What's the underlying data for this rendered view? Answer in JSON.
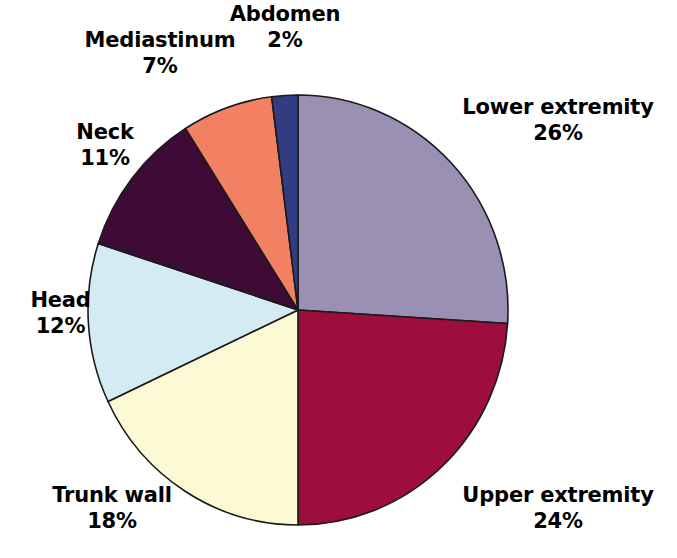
{
  "chart_data": {
    "type": "pie",
    "title": "",
    "subtitle": "",
    "xlabel": "",
    "ylabel": "",
    "legend_position": "none",
    "grid": false,
    "value_unit": "%",
    "start_angle_deg": 0,
    "direction": "clockwise",
    "categories": [
      "Lower extremity",
      "Upper extremity",
      "Trunk wall",
      "Head",
      "Neck",
      "Mediastinum",
      "Abdomen"
    ],
    "values": [
      26,
      24,
      18,
      12,
      11,
      7,
      2
    ],
    "colors": [
      "#9a90b4",
      "#9d0e3e",
      "#fcfad4",
      "#d5ebf3",
      "#3e0b36",
      "#f28063",
      "#313d80"
    ],
    "slices": [
      {
        "label": "Lower extremity",
        "value": 26,
        "value_text": "26%",
        "color": "#9a90b4"
      },
      {
        "label": "Upper extremity",
        "value": 24,
        "value_text": "24%",
        "color": "#9d0e3e"
      },
      {
        "label": "Trunk wall",
        "value": 18,
        "value_text": "18%",
        "color": "#fcfad4"
      },
      {
        "label": "Head",
        "value": 12,
        "value_text": "12%",
        "color": "#d5ebf3"
      },
      {
        "label": "Neck",
        "value": 11,
        "value_text": "11%",
        "color": "#3e0b36"
      },
      {
        "label": "Mediastinum",
        "value": 7,
        "value_text": "7%",
        "color": "#f28063"
      },
      {
        "label": "Abdomen",
        "value": 2,
        "value_text": "2%",
        "color": "#313d80"
      }
    ]
  },
  "labels": {
    "abdomen": {
      "name": "Abdomen",
      "value": "2%"
    },
    "mediastinum": {
      "name": "Mediastinum",
      "value": "7%"
    },
    "neck": {
      "name": "Neck",
      "value": "11%"
    },
    "head": {
      "name": "Head",
      "value": "12%"
    },
    "trunk_wall": {
      "name": "Trunk wall",
      "value": "18%"
    },
    "upper_extremity": {
      "name": "Upper extremity",
      "value": "24%"
    },
    "lower_extremity": {
      "name": "Lower extremity",
      "value": "26%"
    }
  },
  "geometry": {
    "center_x": 298,
    "center_y": 310,
    "radius_x": 210,
    "radius_y": 215,
    "stroke_color": "#1a1a1a",
    "stroke_width": 1.6,
    "background": "#ffffff"
  }
}
